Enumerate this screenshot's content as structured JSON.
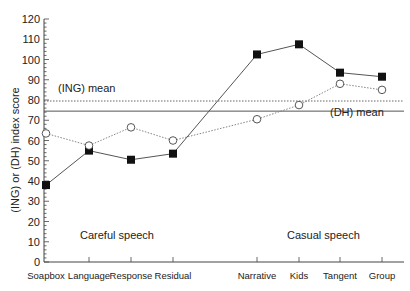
{
  "chart_data": {
    "type": "line",
    "title": "",
    "xlabel": "",
    "ylabel": "(ING) or (DH) index score",
    "ylim": [
      0,
      120
    ],
    "yticks": [
      0,
      10,
      20,
      30,
      40,
      50,
      60,
      70,
      80,
      90,
      100,
      110,
      120
    ],
    "grid": false,
    "categories": [
      "Soapbox",
      "Language",
      "Response",
      "Residual",
      "Narrative",
      "Kids",
      "Tangent",
      "Group"
    ],
    "series": [
      {
        "name": "(DH)",
        "marker": "filled-square",
        "line_style": "solid",
        "values": [
          38,
          55,
          50.5,
          53.5,
          102.5,
          107.5,
          93.5,
          91.5
        ]
      },
      {
        "name": "(ING)",
        "marker": "open-circle",
        "line_style": "dotted",
        "values": [
          63.5,
          57.5,
          66.5,
          60,
          70.5,
          77.5,
          88,
          85
        ]
      }
    ],
    "reference_lines": [
      {
        "label": "(ING) mean",
        "value": 79.5,
        "style": "dotted"
      },
      {
        "label": "(DH) mean",
        "value": 74.5,
        "style": "solid"
      }
    ],
    "annotations": [
      {
        "text": "Careful speech",
        "group": [
          "Soapbox",
          "Language",
          "Response",
          "Residual"
        ]
      },
      {
        "text": "Casual speech",
        "group": [
          "Narrative",
          "Kids",
          "Tangent",
          "Group"
        ]
      }
    ]
  },
  "labels": {
    "ylabel": "(ING) or (DH) index score",
    "ing_mean": "(ING) mean",
    "dh_mean": "(DH) mean",
    "careful": "Careful speech",
    "casual": "Casual speech"
  }
}
